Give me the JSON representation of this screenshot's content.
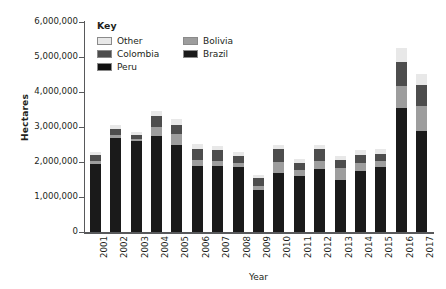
{
  "caption_sliver": "",
  "axes": {
    "y_title": "Hectares",
    "x_title": "Year",
    "y_ticks": [
      "6,000,000",
      "5,000,000",
      "4,000,000",
      "3,000,000",
      "2,000,000",
      "1,000,000",
      "0"
    ]
  },
  "legend": {
    "title": "Key",
    "items": [
      {
        "label": "Other",
        "color": "#e8e8e8"
      },
      {
        "label": "Bolivia",
        "color": "#9d9d9d"
      },
      {
        "label": "Colombia",
        "color": "#4d4d4d"
      },
      {
        "label": "Brazil",
        "color": "#1a1a1a"
      },
      {
        "label": "Peru",
        "color": "#111111"
      }
    ]
  },
  "chart_data": {
    "type": "bar",
    "subtype": "stacked-vertical",
    "title": "",
    "xlabel": "Year",
    "ylabel": "Hectares",
    "ylim": [
      0,
      6000000
    ],
    "ytick_interval": 1000000,
    "grid": false,
    "legend_position": "top-left-inside",
    "categories": [
      "2001",
      "2002",
      "2003",
      "2004",
      "2005",
      "2006",
      "2007",
      "2008",
      "2009",
      "2010",
      "2011",
      "2012",
      "2013",
      "2014",
      "2015",
      "2016",
      "2017"
    ],
    "stack_order_bottom_to_top": [
      "Brazil",
      "Bolivia",
      "Colombia",
      "Other"
    ],
    "series": [
      {
        "name": "Brazil",
        "color": "#1a1a1a",
        "values": [
          1950000,
          2700000,
          2600000,
          2750000,
          2500000,
          1900000,
          1900000,
          1850000,
          1200000,
          1700000,
          1600000,
          1800000,
          1500000,
          1750000,
          1850000,
          3550000,
          2900000
        ]
      },
      {
        "name": "Bolivia",
        "color": "#9d9d9d",
        "values": [
          80000,
          60000,
          70000,
          260000,
          300000,
          170000,
          130000,
          130000,
          110000,
          310000,
          180000,
          220000,
          330000,
          230000,
          180000,
          620000,
          690000
        ]
      },
      {
        "name": "Colombia",
        "color": "#4d4d4d",
        "values": [
          170000,
          180000,
          110000,
          300000,
          270000,
          290000,
          300000,
          200000,
          220000,
          360000,
          200000,
          350000,
          240000,
          230000,
          210000,
          700000,
          620000
        ]
      },
      {
        "name": "Other",
        "color": "#e8e8e8",
        "values": [
          100000,
          110000,
          70000,
          150000,
          160000,
          150000,
          120000,
          110000,
          110000,
          130000,
          120000,
          130000,
          110000,
          130000,
          120000,
          380000,
          300000
        ]
      }
    ],
    "totals": [
      2300000,
      3050000,
      2850000,
      3460000,
      3230000,
      2510000,
      2450000,
      2290000,
      1640000,
      2500000,
      2100000,
      2500000,
      2180000,
      2340000,
      2360000,
      5250000,
      4510000
    ]
  }
}
